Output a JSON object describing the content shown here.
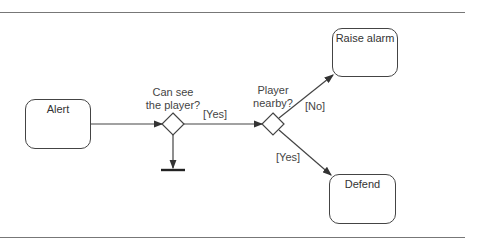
{
  "states": {
    "alert": "Alert",
    "raise_alarm": "Raise alarm",
    "defend": "Defend"
  },
  "decisions": {
    "can_see": {
      "line1": "Can see",
      "line2": "the player?"
    },
    "nearby": {
      "line1": "Player",
      "line2": "nearby?"
    }
  },
  "guards": {
    "can_see_yes": "[Yes]",
    "nearby_no": "[No]",
    "nearby_yes": "[Yes]"
  }
}
